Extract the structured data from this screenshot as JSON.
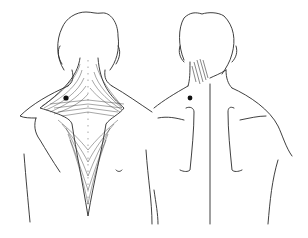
{
  "figure": {
    "panels": [
      {
        "id": "muscle-view",
        "label": "",
        "trigger_point_color": "#111111"
      },
      {
        "id": "referral-view",
        "label": "",
        "trigger_point_color": "#111111",
        "referral_area": "hatched"
      }
    ],
    "colors": {
      "background": "#ffffff",
      "line": "#2a2a2a"
    }
  }
}
